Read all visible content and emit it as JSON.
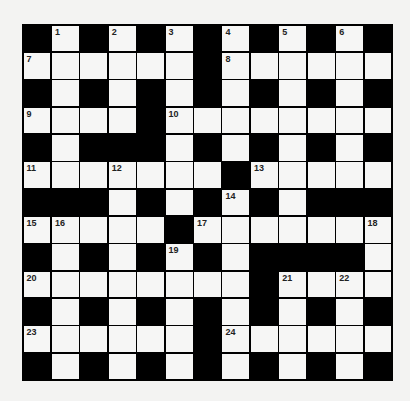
{
  "puzzle": {
    "rows": 13,
    "cols": 13,
    "layout": [
      "#.#.#.#.#.#.#",
      "......#......",
      "#.#.#.#.#.#.#",
      "....#........",
      "#.###.#.#.#.#",
      ".......#.....",
      "###.#.#.#.###",
      ".....#.......",
      "#.#.#.#.####.",
      "........#....",
      "#.#.#.#.#.#.#",
      "......#......",
      "#.#.#.#.#.#.#"
    ],
    "numbers": [
      {
        "row": 0,
        "col": 1,
        "n": "1"
      },
      {
        "row": 0,
        "col": 3,
        "n": "2"
      },
      {
        "row": 0,
        "col": 5,
        "n": "3"
      },
      {
        "row": 0,
        "col": 7,
        "n": "4"
      },
      {
        "row": 0,
        "col": 9,
        "n": "5"
      },
      {
        "row": 0,
        "col": 11,
        "n": "6"
      },
      {
        "row": 1,
        "col": 0,
        "n": "7"
      },
      {
        "row": 1,
        "col": 7,
        "n": "8"
      },
      {
        "row": 3,
        "col": 0,
        "n": "9"
      },
      {
        "row": 3,
        "col": 5,
        "n": "10"
      },
      {
        "row": 5,
        "col": 0,
        "n": "11"
      },
      {
        "row": 5,
        "col": 3,
        "n": "12"
      },
      {
        "row": 5,
        "col": 8,
        "n": "13"
      },
      {
        "row": 6,
        "col": 7,
        "n": "14"
      },
      {
        "row": 7,
        "col": 0,
        "n": "15"
      },
      {
        "row": 7,
        "col": 1,
        "n": "16"
      },
      {
        "row": 7,
        "col": 6,
        "n": "17"
      },
      {
        "row": 7,
        "col": 12,
        "n": "18"
      },
      {
        "row": 8,
        "col": 5,
        "n": "19"
      },
      {
        "row": 9,
        "col": 0,
        "n": "20"
      },
      {
        "row": 9,
        "col": 9,
        "n": "21"
      },
      {
        "row": 9,
        "col": 11,
        "n": "22"
      },
      {
        "row": 11,
        "col": 0,
        "n": "23"
      },
      {
        "row": 11,
        "col": 7,
        "n": "24"
      }
    ]
  }
}
